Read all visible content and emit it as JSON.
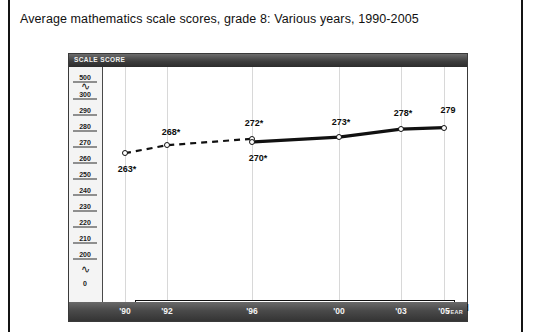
{
  "figure": {
    "title": "Average mathematics scale scores, grade 8: Various years, 1990-2005",
    "scale_axis_header": "SCALE SCORE",
    "year_axis_name": "YEAR",
    "key_word": "KEY"
  },
  "legend": {
    "dashed_label": "Accommodations not permitted",
    "solid_label": "Accommodations permitted"
  },
  "chart_data": {
    "type": "line",
    "title": "Average mathematics scale scores, grade 8: Various years, 1990-2005",
    "xlabel": "YEAR",
    "ylabel": "SCALE SCORE",
    "x": [
      "'90",
      "'92",
      "'96",
      "'00",
      "'03",
      "'05"
    ],
    "categories": [
      "'90",
      "'92",
      "'96",
      "'00",
      "'03",
      "'05"
    ],
    "ylim": [
      200,
      300
    ],
    "y_axis_has_breaks": true,
    "y_tick_labels": [
      "500",
      "300",
      "290",
      "280",
      "270",
      "260",
      "250",
      "240",
      "230",
      "220",
      "210",
      "200",
      "0"
    ],
    "grid": true,
    "legend_position": "bottom",
    "series": [
      {
        "name": "Accommodations not permitted",
        "style": "dashed",
        "x": [
          "'90",
          "'92",
          "'96"
        ],
        "values": [
          263,
          268,
          272
        ],
        "labels": [
          "263*",
          "268*",
          "272*"
        ]
      },
      {
        "name": "Accommodations permitted",
        "style": "solid",
        "x": [
          "'96",
          "'00",
          "'03",
          "'05"
        ],
        "values": [
          270,
          273,
          278,
          279
        ],
        "labels": [
          "270*",
          "273*",
          "278*",
          "279"
        ]
      }
    ],
    "annotations": [
      "* Significantly different from 2005."
    ]
  },
  "yticks": [
    {
      "label": "500",
      "rule": true
    },
    {
      "label": "300",
      "rule": true
    },
    {
      "label": "290",
      "rule": true
    },
    {
      "label": "280",
      "rule": true
    },
    {
      "label": "270",
      "rule": true
    },
    {
      "label": "260",
      "rule": true
    },
    {
      "label": "250",
      "rule": true
    },
    {
      "label": "240",
      "rule": true
    },
    {
      "label": "230",
      "rule": true
    },
    {
      "label": "220",
      "rule": true
    },
    {
      "label": "210",
      "rule": true
    },
    {
      "label": "200",
      "rule": true
    },
    {
      "label": "0",
      "rule": false
    }
  ],
  "colors": {
    "line": "#111111",
    "grid": "#d8d8d8",
    "header_bar": "#3e3e3e",
    "axis_panel": "#f4f4f4"
  }
}
